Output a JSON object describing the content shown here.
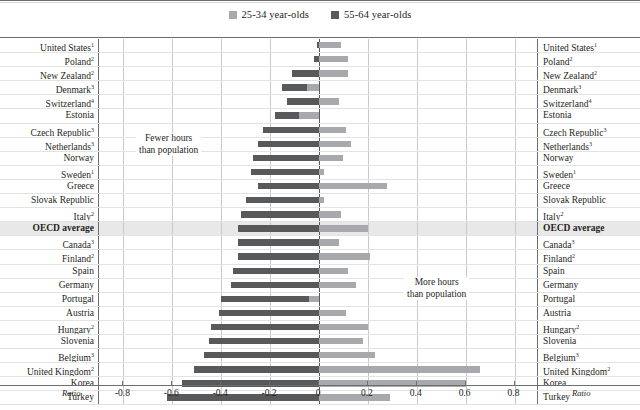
{
  "legend": {
    "items": [
      {
        "label": "25-34 year-olds",
        "color": "#a7a9ac",
        "key": "y2534"
      },
      {
        "label": "55-64 year-olds",
        "color": "#58595b",
        "key": "y5564"
      }
    ]
  },
  "annotations": {
    "left_line1": "Fewer hours",
    "left_line2": "than population",
    "right_line1": "More hours",
    "right_line2": "than population"
  },
  "axis": {
    "unit_label_left": "Ratio",
    "unit_label_right": "Ratio",
    "ticks": [
      "-0.8",
      "-0.6",
      "-0.4",
      "-0.2",
      "0",
      "0.2",
      "0.4",
      "0.6",
      "0.8"
    ],
    "min": -0.9,
    "max": 0.9
  },
  "chart_data": {
    "type": "bar",
    "orientation": "horizontal",
    "title": "",
    "xlabel": "Ratio",
    "ylabel": "",
    "xlim": [
      -0.9,
      0.9
    ],
    "grid": true,
    "legend_position": "top-center",
    "categories": [
      "United States",
      "Poland",
      "New Zealand",
      "Denmark",
      "Switzerland",
      "Estonia",
      "Czech Republic",
      "Netherlands",
      "Norway",
      "Sweden",
      "Greece",
      "Slovak Republic",
      "Italy",
      "OECD average",
      "Canada",
      "Finland",
      "Spain",
      "Germany",
      "Portugal",
      "Austria",
      "Hungary",
      "Slovenia",
      "Belgium",
      "United Kingdom",
      "Korea",
      "Turkey"
    ],
    "category_footnotes": [
      "1",
      "2",
      "2",
      "3",
      "4",
      "",
      "3",
      "3",
      "",
      "1",
      "",
      "",
      "2",
      "",
      "3",
      "2",
      "",
      "",
      "",
      "",
      "2",
      "",
      "3",
      "2",
      "",
      ""
    ],
    "highlight_category": "OECD average",
    "series": [
      {
        "name": "25-34 year-olds",
        "color": "#a7a9ac",
        "values": [
          0.09,
          0.12,
          0.12,
          -0.05,
          0.08,
          -0.08,
          0.11,
          0.13,
          0.1,
          0.02,
          0.28,
          0.02,
          0.09,
          0.2,
          0.08,
          0.21,
          0.12,
          0.15,
          -0.04,
          0.11,
          0.2,
          0.18,
          0.23,
          0.66,
          0.6,
          0.29
        ]
      },
      {
        "name": "55-64 year-olds",
        "color": "#58595b",
        "values": [
          -0.01,
          -0.02,
          -0.11,
          -0.15,
          -0.13,
          -0.18,
          -0.23,
          -0.25,
          -0.27,
          -0.28,
          -0.25,
          -0.3,
          -0.32,
          -0.33,
          -0.33,
          -0.33,
          -0.35,
          -0.36,
          -0.4,
          -0.41,
          -0.44,
          -0.45,
          -0.47,
          -0.51,
          -0.56,
          -0.62
        ]
      }
    ]
  }
}
